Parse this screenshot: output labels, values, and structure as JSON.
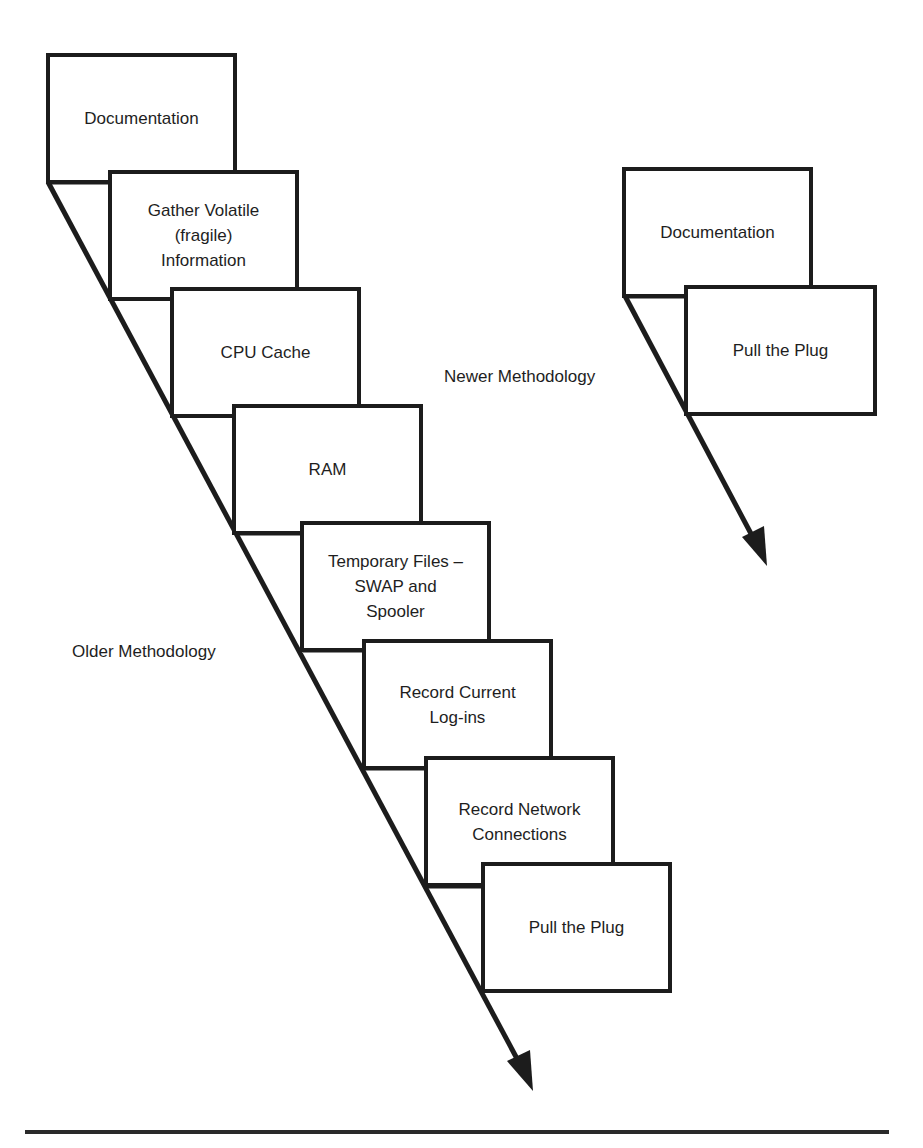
{
  "older_methodology": {
    "label": "Older Methodology",
    "steps": [
      {
        "label": "Documentation"
      },
      {
        "label": "Gather Volatile\n(fragile)\nInformation"
      },
      {
        "label": "CPU Cache"
      },
      {
        "label": "RAM"
      },
      {
        "label": "Temporary Files –\nSWAP and\nSpooler"
      },
      {
        "label": "Record Current\nLog-ins"
      },
      {
        "label": "Record Network\nConnections"
      },
      {
        "label": "Pull the Plug"
      }
    ]
  },
  "newer_methodology": {
    "label": "Newer Methodology",
    "steps": [
      {
        "label": "Documentation"
      },
      {
        "label": "Pull the Plug"
      }
    ]
  },
  "colors": {
    "stroke": "#1c1c1c",
    "background": "#ffffff",
    "text": "#1e1e1e"
  }
}
